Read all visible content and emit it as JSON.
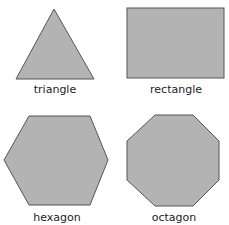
{
  "shapes": [
    {
      "name": "triangle",
      "label": "triangle"
    },
    {
      "name": "rectangle",
      "label": "rectangle"
    },
    {
      "name": "hexagon",
      "label": "hexagon"
    },
    {
      "name": "octagon",
      "label": "octagon"
    }
  ],
  "colors": {
    "fill": "#b3b3b3",
    "stroke": "#555555",
    "text": "#222222"
  }
}
